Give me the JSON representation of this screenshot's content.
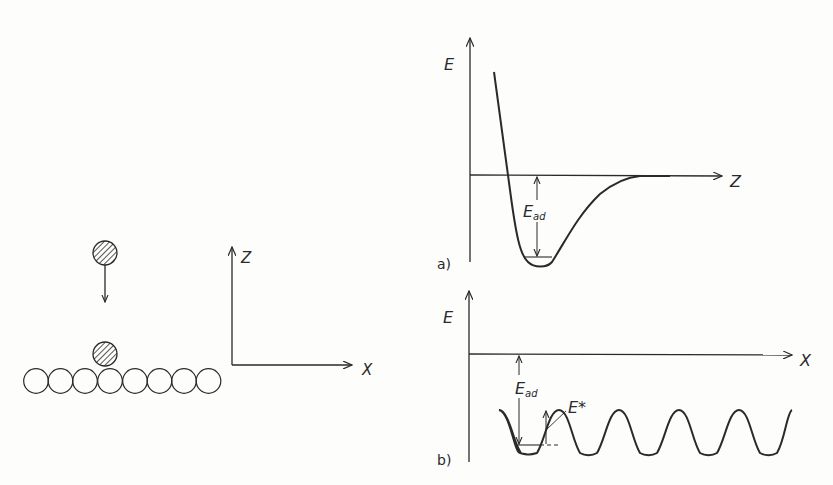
{
  "diagram": {
    "left_panel": {
      "description": "Adatom approaching surface atom row",
      "surface_atoms_count": 8,
      "axes": {
        "vertical": "Z",
        "horizontal": "X"
      }
    },
    "panel_a": {
      "panel_label": "a)",
      "y_axis": "E",
      "x_axis": "Z",
      "annotation_main": "E",
      "annotation_sub": "ad",
      "curve": "Lennard-Jones-type potential well"
    },
    "panel_b": {
      "panel_label": "b)",
      "y_axis": "E",
      "x_axis": "X",
      "annotation_main": "E",
      "annotation_sub": "ad",
      "barrier_label": "E*",
      "curve": "periodic corrugation potential",
      "periods": 6
    }
  }
}
